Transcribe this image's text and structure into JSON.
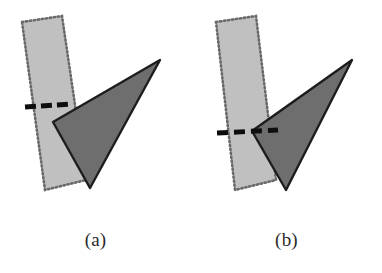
{
  "figure": {
    "background_color": "#ffffff",
    "width": 382,
    "height": 273,
    "panels": [
      {
        "id": "panel-a",
        "caption": "(a)",
        "description": "Light gray dotted-outline slanted strip overlapped by a dark gray triangle; a short dashed segment crosses the strip above the triangle's left vertex.",
        "strip": {
          "name": "dotted-strip",
          "fill_color": "#c0c0c0",
          "border_color": "#6b6b6b",
          "border_style": "dotted",
          "points": "22,22 62,16 86,180 45,190"
        },
        "triangle": {
          "name": "dark-triangle",
          "fill_color": "#6e6e6e",
          "stroke_color": "#1f1f1f",
          "points": "160,60 53,122 90,188"
        },
        "dashed_line": {
          "name": "dashed-cut-line",
          "color": "#111111",
          "x1": 25,
          "y1": 107,
          "x2": 72,
          "y2": 104,
          "dash_count": 3,
          "width": 5
        }
      },
      {
        "id": "panel-b",
        "caption": "(b)",
        "description": "Same light gray dotted strip and dark gray triangle, but the triangle is shifted so its left vertex lies on the dashed line, which passes through the strip and into the triangle.",
        "strip": {
          "name": "dotted-strip",
          "fill_color": "#c0c0c0",
          "border_color": "#6b6b6b",
          "border_style": "dotted",
          "points": "216,22 256,16 276,180 235,190"
        },
        "triangle": {
          "name": "dark-triangle",
          "fill_color": "#6e6e6e",
          "stroke_color": "#1f1f1f",
          "points": "352,60 252,131 286,190"
        },
        "dashed_line": {
          "name": "dashed-cut-line",
          "color": "#111111",
          "x1": 217,
          "y1": 133,
          "x2": 278,
          "y2": 130,
          "dash_count": 3,
          "width": 5
        }
      }
    ]
  },
  "captions": {
    "a": "(a)",
    "b": "(b)"
  }
}
